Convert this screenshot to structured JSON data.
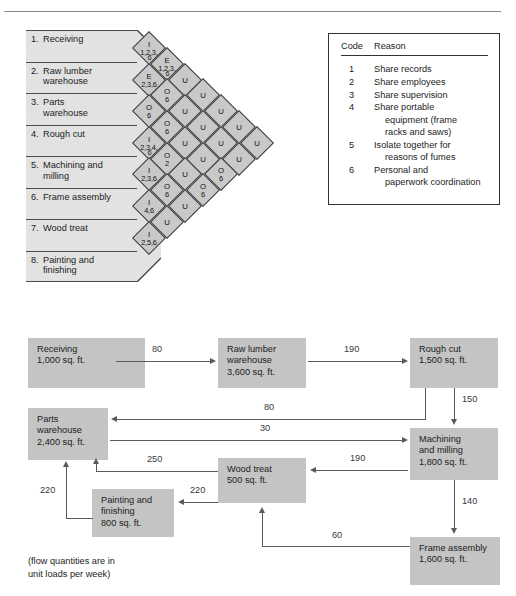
{
  "rel_chart": {
    "departments": [
      {
        "num": "1.",
        "line1": "Receiving",
        "line2": ""
      },
      {
        "num": "2.",
        "line1": "Raw lumber",
        "line2": "warehouse"
      },
      {
        "num": "3.",
        "line1": "Parts",
        "line2": "warehouse"
      },
      {
        "num": "4.",
        "line1": "Rough cut",
        "line2": ""
      },
      {
        "num": "5.",
        "line1": "Machining and",
        "line2": "milling"
      },
      {
        "num": "6.",
        "line1": "Frame assembly",
        "line2": ""
      },
      {
        "num": "7.",
        "line1": "Wood treat",
        "line2": ""
      },
      {
        "num": "8.",
        "line1": "Painting and",
        "line2": "finishing"
      }
    ],
    "diamonds": [
      {
        "col": 0,
        "row": 0,
        "code": "I",
        "reasons": "1,2,3,"
      },
      {
        "col": 0,
        "row": 1,
        "code": "E",
        "reasons": "2,3,6"
      },
      {
        "col": 0,
        "row": 2,
        "code": "O",
        "reasons": "6"
      },
      {
        "col": 0,
        "row": 3,
        "code": "I",
        "reasons": "2,3,4,"
      },
      {
        "col": 0,
        "row": 4,
        "code": "I",
        "reasons": "2,3,6"
      },
      {
        "col": 0,
        "row": 5,
        "code": "I",
        "reasons": "4,6"
      },
      {
        "col": 0,
        "row": 6,
        "code": "I",
        "reasons": "2,5,6"
      },
      {
        "col": 1,
        "row": 0,
        "code": "E",
        "reasons": "1,2,3,"
      },
      {
        "col": 1,
        "row": 1,
        "code": "O",
        "reasons": "6"
      },
      {
        "col": 1,
        "row": 2,
        "code": "O",
        "reasons": "6"
      },
      {
        "col": 1,
        "row": 3,
        "code": "O",
        "reasons": "2"
      },
      {
        "col": 1,
        "row": 4,
        "code": "O",
        "reasons": "6"
      },
      {
        "col": 1,
        "row": 5,
        "code": "U",
        "reasons": ""
      },
      {
        "col": 2,
        "row": 0,
        "code": "U",
        "reasons": ""
      },
      {
        "col": 2,
        "row": 1,
        "code": "U",
        "reasons": ""
      },
      {
        "col": 2,
        "row": 2,
        "code": "U",
        "reasons": ""
      },
      {
        "col": 2,
        "row": 3,
        "code": "U",
        "reasons": ""
      },
      {
        "col": 2,
        "row": 4,
        "code": "U",
        "reasons": ""
      },
      {
        "col": 3,
        "row": 0,
        "code": "U",
        "reasons": ""
      },
      {
        "col": 3,
        "row": 1,
        "code": "U",
        "reasons": ""
      },
      {
        "col": 3,
        "row": 2,
        "code": "U",
        "reasons": ""
      },
      {
        "col": 3,
        "row": 3,
        "code": "O",
        "reasons": "6"
      },
      {
        "col": 4,
        "row": 0,
        "code": "U",
        "reasons": ""
      },
      {
        "col": 4,
        "row": 1,
        "code": "U",
        "reasons": ""
      },
      {
        "col": 4,
        "row": 2,
        "code": "O",
        "reasons": "6"
      },
      {
        "col": 5,
        "row": 0,
        "code": "U",
        "reasons": ""
      },
      {
        "col": 5,
        "row": 1,
        "code": "U",
        "reasons": ""
      },
      {
        "col": 6,
        "row": 0,
        "code": "U",
        "reasons": ""
      }
    ],
    "sub_reasons": {
      "d00": "6",
      "d03": "6",
      "d10": "6"
    }
  },
  "legend": {
    "header": {
      "code": "Code",
      "reason": "Reason"
    },
    "rows": [
      {
        "code": "1",
        "text": "Share records",
        "cont1": "",
        "cont2": ""
      },
      {
        "code": "2",
        "text": "Share employees",
        "cont1": "",
        "cont2": ""
      },
      {
        "code": "3",
        "text": "Share supervision",
        "cont1": "",
        "cont2": ""
      },
      {
        "code": "4",
        "text": "Share portable",
        "cont1": "equipment (frame",
        "cont2": "racks and saws)"
      },
      {
        "code": "5",
        "text": "Isolate together for",
        "cont1": "reasons of fumes",
        "cont2": ""
      },
      {
        "code": "6",
        "text": "Personal and",
        "cont1": "paperwork coordination",
        "cont2": ""
      }
    ]
  },
  "flow": {
    "nodes": {
      "receiving": {
        "name": "Receiving",
        "name2": "",
        "area": "1,000 sq. ft."
      },
      "raw_lumber": {
        "name": "Raw lumber",
        "name2": "warehouse",
        "area": "3,600 sq. ft."
      },
      "rough_cut": {
        "name": "Rough cut",
        "name2": "",
        "area": "1,500 sq. ft."
      },
      "parts": {
        "name": "Parts",
        "name2": "warehouse",
        "area": "2,400 sq. ft."
      },
      "machining": {
        "name": "Machining",
        "name2": "and milling",
        "area": "1,800 sq. ft."
      },
      "wood_treat": {
        "name": "Wood treat",
        "name2": "",
        "area": "500 sq. ft."
      },
      "painting": {
        "name": "Painting and",
        "name2": "finishing",
        "area": "800 sq. ft."
      },
      "frame": {
        "name": "Frame assembly",
        "name2": "",
        "area": "1,600 sq. ft."
      }
    },
    "flows": {
      "receiving_to_raw": "80",
      "raw_to_rough": "190",
      "rough_to_machining": "150",
      "rough_to_parts": "80",
      "parts_to_machining": "30",
      "machining_to_wood": "190",
      "machining_to_frame": "140",
      "wood_to_parts": "250",
      "wood_to_painting": "220",
      "painting_to_parts": "220",
      "frame_to_wood": "60"
    },
    "note_line1": "(flow quantities are in",
    "note_line2": "unit loads per week)"
  }
}
